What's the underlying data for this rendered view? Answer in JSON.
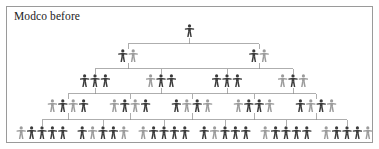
{
  "chart_title": "Modco before",
  "diagram": {
    "type": "organizational-hierarchy-tree",
    "subject": "Modco",
    "phase": "before",
    "icon_name": "person-figure-icon",
    "levels": [
      {
        "level": 1,
        "label": "top",
        "node_count": 1,
        "figures_per_node": 1,
        "total_figures": 1,
        "y": 18,
        "nodes": [
          {
            "id": "L1N1",
            "center_x": 183.5,
            "figures": 1,
            "shades": [
              "dark"
            ]
          }
        ]
      },
      {
        "level": 2,
        "node_count": 2,
        "figures_per_node": 2,
        "total_figures": 4,
        "y": 43,
        "nodes": [
          {
            "id": "L2N1",
            "center_x": 122,
            "figures": 2,
            "shades": [
              "dark",
              "light"
            ]
          },
          {
            "id": "L2N2",
            "center_x": 253,
            "figures": 2,
            "shades": [
              "dark",
              "light"
            ]
          }
        ]
      },
      {
        "level": 3,
        "node_count": 4,
        "figures_per_node": 3,
        "total_figures": 12,
        "y": 68,
        "nodes": [
          {
            "id": "L3N1",
            "center_x": 89,
            "figures": 3,
            "shades": [
              "dark",
              "dark",
              "dark"
            ]
          },
          {
            "id": "L3N2",
            "center_x": 155,
            "figures": 3,
            "shades": [
              "light",
              "dark",
              "dark"
            ]
          },
          {
            "id": "L3N3",
            "center_x": 221,
            "figures": 3,
            "shades": [
              "dark",
              "dark",
              "dark"
            ]
          },
          {
            "id": "L3N4",
            "center_x": 287,
            "figures": 3,
            "shades": [
              "light",
              "dark",
              "light"
            ]
          }
        ]
      },
      {
        "level": 4,
        "node_count": 5,
        "figures_per_node": 4,
        "total_figures": 20,
        "y": 93,
        "nodes": [
          {
            "id": "L4N1",
            "center_x": 62,
            "figures": 4,
            "shades": [
              "light",
              "dark",
              "light",
              "dark"
            ]
          },
          {
            "id": "L4N2",
            "center_x": 124,
            "figures": 4,
            "shades": [
              "light",
              "dark",
              "light",
              "dark"
            ]
          },
          {
            "id": "L4N3",
            "center_x": 186,
            "figures": 4,
            "shades": [
              "dark",
              "light",
              "dark",
              "light"
            ]
          },
          {
            "id": "L4N4",
            "center_x": 248,
            "figures": 4,
            "shades": [
              "light",
              "dark",
              "dark",
              "light"
            ]
          },
          {
            "id": "L4N5",
            "center_x": 310,
            "figures": 4,
            "shades": [
              "dark",
              "light",
              "dark",
              "light"
            ]
          }
        ]
      },
      {
        "level": 5,
        "label": "base",
        "node_count": 6,
        "figures_per_node": 5,
        "total_figures": 30,
        "y": 120,
        "nodes": [
          {
            "id": "L5N1",
            "center_x": 36,
            "figures": 5,
            "shades": [
              "light",
              "dark",
              "dark",
              "dark",
              "dark"
            ]
          },
          {
            "id": "L5N2",
            "center_x": 97,
            "figures": 5,
            "shades": [
              "dark",
              "light",
              "dark",
              "dark",
              "light"
            ]
          },
          {
            "id": "L5N3",
            "center_x": 158,
            "figures": 5,
            "shades": [
              "light",
              "dark",
              "dark",
              "dark",
              "dark"
            ]
          },
          {
            "id": "L5N4",
            "center_x": 219,
            "figures": 5,
            "shades": [
              "dark",
              "light",
              "dark",
              "dark",
              "dark"
            ]
          },
          {
            "id": "L5N5",
            "center_x": 280,
            "figures": 5,
            "shades": [
              "light",
              "dark",
              "dark",
              "dark",
              "dark"
            ]
          },
          {
            "id": "L5N6",
            "center_x": 341,
            "figures": 5,
            "shades": [
              "light",
              "dark",
              "dark",
              "dark",
              "light"
            ]
          }
        ]
      }
    ],
    "totals": {
      "levels": 5,
      "nodes": 18,
      "figures": 67
    }
  },
  "colors": {
    "background": "#ffffff",
    "border": "#9a9a9a",
    "connector": "#8c8c8c",
    "figure_dark": "#3a3a3a",
    "figure_light": "#9b9b9b",
    "title_text": "#1b1b1b"
  },
  "layout": {
    "figure_width": 9.2,
    "figure_height": 13,
    "figure_gap": 1.2
  }
}
